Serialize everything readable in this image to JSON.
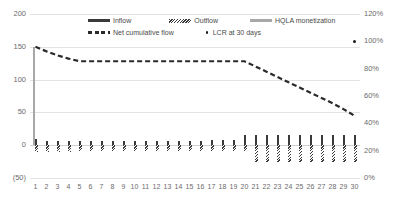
{
  "chart_data": {
    "type": "bar",
    "title": "",
    "subtitle": "",
    "xlabel": "",
    "ylabel": "",
    "y2label": "",
    "categories": [
      1,
      2,
      3,
      4,
      5,
      6,
      7,
      8,
      9,
      10,
      11,
      12,
      13,
      14,
      15,
      16,
      17,
      18,
      19,
      20,
      21,
      22,
      23,
      24,
      25,
      26,
      27,
      28,
      29,
      30
    ],
    "ylim": [
      -50,
      200
    ],
    "y2lim": [
      0,
      120
    ],
    "yticks": [
      "(50)",
      "0",
      "50",
      "100",
      "150",
      "200"
    ],
    "ytick_values": [
      -50,
      0,
      50,
      100,
      150,
      200
    ],
    "y2ticks": [
      "0%",
      "20%",
      "40%",
      "60%",
      "80%",
      "100%",
      "120%"
    ],
    "y2tick_values": [
      0,
      20,
      40,
      60,
      80,
      100,
      120
    ],
    "grid": true,
    "legend_position": "top-center",
    "series": [
      {
        "name": "Inflow",
        "type": "bar",
        "axis": "left",
        "color": "#3a3a3a",
        "values": [
          9,
          7,
          6,
          6,
          6,
          6,
          6,
          6,
          7,
          7,
          7,
          7,
          7,
          7,
          7,
          7,
          8,
          8,
          8,
          16,
          16,
          16,
          16,
          16,
          16,
          16,
          16,
          16,
          16,
          16
        ]
      },
      {
        "name": "Outflow",
        "type": "bar",
        "axis": "left",
        "color": "#3a3a3a",
        "pattern": "hatched",
        "values": [
          -10,
          -11,
          -11,
          -11,
          -9,
          -9,
          -9,
          -9,
          -9,
          -9,
          -9,
          -9,
          -9,
          -9,
          -9,
          -9,
          -9,
          -9,
          -9,
          -9,
          -25,
          -25,
          -25,
          -25,
          -25,
          -25,
          -25,
          -25,
          -25,
          -25
        ]
      },
      {
        "name": "HQLA monetization",
        "type": "bar",
        "axis": "left",
        "color": "#a8a8a8",
        "values": [
          150,
          0,
          0,
          0,
          0,
          0,
          0,
          0,
          0,
          0,
          0,
          0,
          0,
          0,
          0,
          0,
          0,
          0,
          0,
          0,
          0,
          0,
          0,
          0,
          0,
          0,
          0,
          0,
          0,
          0
        ]
      },
      {
        "name": "Net cumulative flow",
        "type": "line",
        "style": "dashed",
        "axis": "left",
        "color": "#2a2a2a",
        "values": [
          150,
          143,
          137,
          132,
          128,
          128,
          128,
          128,
          128,
          128,
          128,
          128,
          128,
          128,
          128,
          128,
          128,
          128,
          128,
          128,
          120,
          112,
          104,
          96,
          88,
          80,
          72,
          64,
          55,
          45
        ]
      },
      {
        "name": "LCR at 30 days",
        "type": "scatter",
        "axis": "right",
        "color": "#1a1a1a",
        "points": [
          {
            "x": 30,
            "y": 100
          }
        ]
      }
    ]
  },
  "legend": {
    "items": [
      {
        "label": "Inflow",
        "marker": "solid-bar-swatch"
      },
      {
        "label": "Outflow",
        "marker": "hatched-bar-swatch"
      },
      {
        "label": "HQLA monetization",
        "marker": "gray-bar-swatch"
      },
      {
        "label": "Net cumulative flow",
        "marker": "dashed-line-swatch"
      },
      {
        "label": "LCR at 30 days",
        "marker": "dot-swatch"
      }
    ]
  }
}
